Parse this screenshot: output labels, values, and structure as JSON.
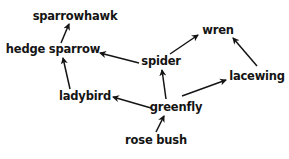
{
  "diagram": {
    "type": "food web",
    "colors": {
      "text": "#141414",
      "arrow": "#141414",
      "background": "#ffffff"
    },
    "nodes": {
      "sparrowhawk": {
        "label": "sparrowhawk",
        "x": 75,
        "y": 17
      },
      "hedge_sparrow": {
        "label": "hedge sparrow",
        "x": 53,
        "y": 50
      },
      "wren": {
        "label": "wren",
        "x": 218,
        "y": 31
      },
      "spider": {
        "label": "spider",
        "x": 161,
        "y": 62
      },
      "lacewing": {
        "label": "lacewing",
        "x": 257,
        "y": 77
      },
      "ladybird": {
        "label": "ladybird",
        "x": 85,
        "y": 97
      },
      "greenfly": {
        "label": "greenfly",
        "x": 176,
        "y": 108
      },
      "rose_bush": {
        "label": "rose bush",
        "x": 156,
        "y": 141
      }
    },
    "edges": [
      {
        "from": "hedge_sparrow",
        "to": "sparrowhawk"
      },
      {
        "from": "spider",
        "to": "hedge_sparrow"
      },
      {
        "from": "spider",
        "to": "wren"
      },
      {
        "from": "lacewing",
        "to": "wren"
      },
      {
        "from": "greenfly",
        "to": "spider"
      },
      {
        "from": "greenfly",
        "to": "lacewing"
      },
      {
        "from": "greenfly",
        "to": "ladybird"
      },
      {
        "from": "ladybird",
        "to": "hedge_sparrow"
      },
      {
        "from": "rose_bush",
        "to": "greenfly"
      }
    ]
  }
}
